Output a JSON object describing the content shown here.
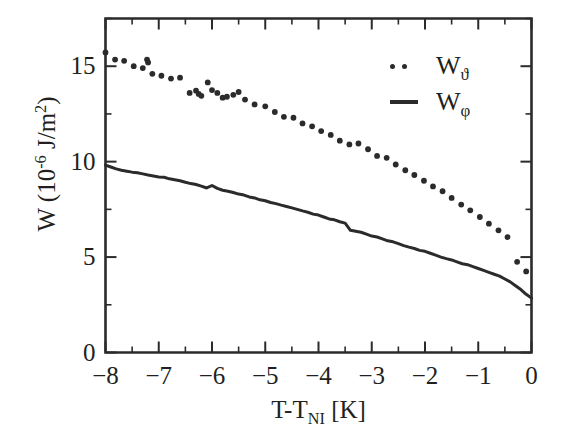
{
  "figure": {
    "background": "#ffffff",
    "ink_color": "#2b2b2b"
  },
  "chart_data": {
    "type": "scatter",
    "title": "",
    "xlabel_parts": {
      "pre": "T-T",
      "sub": "NI",
      "post": " [K]"
    },
    "xlabel": "T-TNI [K]",
    "ylabel_parts": {
      "pre": "W (10",
      "sup": "-6",
      "post": " J/m",
      "sup2": "2",
      "tail": ")"
    },
    "ylabel": "W (10-6 J/m2)",
    "xlim": [
      -8,
      0
    ],
    "ylim": [
      0,
      17.5
    ],
    "xticks": [
      -8,
      -7,
      -6,
      -5,
      -4,
      -3,
      -2,
      -1,
      0
    ],
    "xticklabels": [
      "−8",
      "−7",
      "−6",
      "−5",
      "−4",
      "−3",
      "−2",
      "−1",
      "0"
    ],
    "xminorticks": [
      -7.5,
      -6.5,
      -5.5,
      -4.5,
      -3.5,
      -2.5,
      -1.5,
      -0.5
    ],
    "yticks": [
      0,
      5,
      10,
      15
    ],
    "yticklabels": [
      "0",
      "5",
      "10",
      "15"
    ],
    "yminorticks": [
      2.5,
      7.5,
      12.5,
      17.5
    ],
    "grid": false,
    "legend_position": "upper right",
    "series": [
      {
        "name": "W_theta",
        "label_base": "W",
        "label_sub": "ϑ",
        "style": "dotted",
        "marker": "dot",
        "x": [
          -8.0,
          -7.82,
          -7.65,
          -7.47,
          -7.3,
          -7.22,
          -7.2,
          -7.12,
          -6.95,
          -6.77,
          -6.6,
          -6.42,
          -6.3,
          -6.25,
          -6.2,
          -6.08,
          -6.0,
          -5.9,
          -5.8,
          -5.72,
          -5.6,
          -5.5,
          -5.38,
          -5.2,
          -5.0,
          -4.82,
          -4.65,
          -4.47,
          -4.3,
          -4.12,
          -3.95,
          -3.77,
          -3.6,
          -3.42,
          -3.25,
          -3.07,
          -2.9,
          -2.72,
          -2.55,
          -2.37,
          -2.2,
          -2.02,
          -1.85,
          -1.67,
          -1.5,
          -1.32,
          -1.15,
          -0.97,
          -0.8,
          -0.62,
          -0.45,
          -0.27,
          -0.1
        ],
        "y": [
          15.72,
          15.35,
          15.28,
          15.0,
          14.9,
          15.35,
          15.2,
          14.6,
          14.5,
          14.35,
          14.4,
          13.6,
          13.72,
          13.55,
          13.45,
          14.15,
          13.75,
          13.6,
          13.35,
          13.4,
          13.5,
          13.65,
          13.25,
          13.0,
          12.9,
          12.6,
          12.35,
          12.3,
          12.0,
          11.85,
          11.6,
          11.4,
          11.1,
          10.9,
          10.95,
          10.65,
          10.3,
          10.2,
          9.85,
          9.55,
          9.3,
          9.0,
          8.7,
          8.45,
          8.1,
          7.75,
          7.45,
          7.1,
          6.75,
          6.4,
          6.05,
          4.75,
          4.25
        ]
      },
      {
        "name": "W_phi",
        "label_base": "W",
        "label_sub": "φ",
        "style": "solid",
        "marker": "none",
        "x": [
          -8.0,
          -7.9,
          -7.8,
          -7.7,
          -7.6,
          -7.5,
          -7.4,
          -7.3,
          -7.2,
          -7.1,
          -7.0,
          -6.9,
          -6.8,
          -6.7,
          -6.6,
          -6.5,
          -6.4,
          -6.3,
          -6.2,
          -6.1,
          -6.0,
          -5.9,
          -5.8,
          -5.7,
          -5.6,
          -5.5,
          -5.4,
          -5.3,
          -5.2,
          -5.1,
          -5.0,
          -4.9,
          -4.8,
          -4.7,
          -4.6,
          -4.5,
          -4.4,
          -4.3,
          -4.2,
          -4.1,
          -4.0,
          -3.9,
          -3.8,
          -3.7,
          -3.6,
          -3.5,
          -3.4,
          -3.3,
          -3.2,
          -3.1,
          -3.0,
          -2.9,
          -2.8,
          -2.7,
          -2.6,
          -2.5,
          -2.4,
          -2.3,
          -2.2,
          -2.1,
          -2.0,
          -1.9,
          -1.8,
          -1.7,
          -1.6,
          -1.5,
          -1.4,
          -1.3,
          -1.2,
          -1.1,
          -1.0,
          -0.9,
          -0.8,
          -0.7,
          -0.6,
          -0.5,
          -0.4,
          -0.3,
          -0.2,
          -0.1,
          0.0
        ],
        "y": [
          9.82,
          9.72,
          9.62,
          9.55,
          9.5,
          9.45,
          9.42,
          9.36,
          9.3,
          9.25,
          9.2,
          9.18,
          9.1,
          9.05,
          9.0,
          8.92,
          8.85,
          8.8,
          8.72,
          8.62,
          8.75,
          8.6,
          8.5,
          8.45,
          8.38,
          8.3,
          8.25,
          8.15,
          8.1,
          8.0,
          7.95,
          7.86,
          7.8,
          7.72,
          7.65,
          7.58,
          7.5,
          7.42,
          7.35,
          7.25,
          7.2,
          7.1,
          7.0,
          6.95,
          6.85,
          6.78,
          6.4,
          6.35,
          6.3,
          6.2,
          6.1,
          6.05,
          5.95,
          5.85,
          5.8,
          5.7,
          5.6,
          5.52,
          5.45,
          5.35,
          5.3,
          5.2,
          5.1,
          5.0,
          4.92,
          4.85,
          4.75,
          4.65,
          4.6,
          4.5,
          4.4,
          4.3,
          4.2,
          4.1,
          4.0,
          3.85,
          3.7,
          3.5,
          3.3,
          3.05,
          2.85
        ]
      }
    ]
  }
}
